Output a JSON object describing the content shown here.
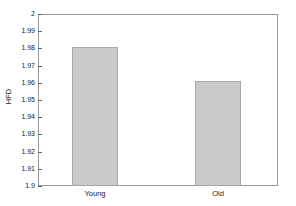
{
  "chart_data": {
    "type": "bar",
    "title": "",
    "subtitle": "",
    "xlabel": "",
    "ylabel": "HFD",
    "categories": [
      "Young",
      "Old"
    ],
    "values": [
      1.981,
      1.961
    ],
    "series": [
      {
        "name": "HFD",
        "values": [
          1.981,
          1.961
        ]
      }
    ],
    "ylim": [
      1.9,
      2.0
    ],
    "ytick_labels": [
      "2",
      "1.99",
      "1.98",
      "1.97",
      "1.96",
      "1.95",
      "1.94",
      "1.93",
      "1.92",
      "1.91",
      "1.9"
    ],
    "ytick_values": [
      2.0,
      1.99,
      1.98,
      1.97,
      1.96,
      1.95,
      1.94,
      1.93,
      1.92,
      1.91,
      1.9
    ],
    "grid": false,
    "legend": false,
    "legend_position": "none",
    "bar_color": "#c9c9c9",
    "bar_edge_color": "#a8a8a8",
    "axis_color": "#999999",
    "text_color": "#1a1a1a",
    "background": "#ffffff"
  },
  "axis": {
    "y_label": "HFD",
    "y_tick_0": "2",
    "y_tick_1": "1.99",
    "y_tick_2": "1.98",
    "y_tick_3": "1.97",
    "y_tick_4": "1.96",
    "y_tick_5": "1.95",
    "y_tick_6": "1.94",
    "y_tick_7": "1.93",
    "y_tick_8": "1.92",
    "y_tick_9": "1.91",
    "y_tick_10": "1.9",
    "x_tick_0": "Young",
    "x_tick_1": "Old"
  }
}
